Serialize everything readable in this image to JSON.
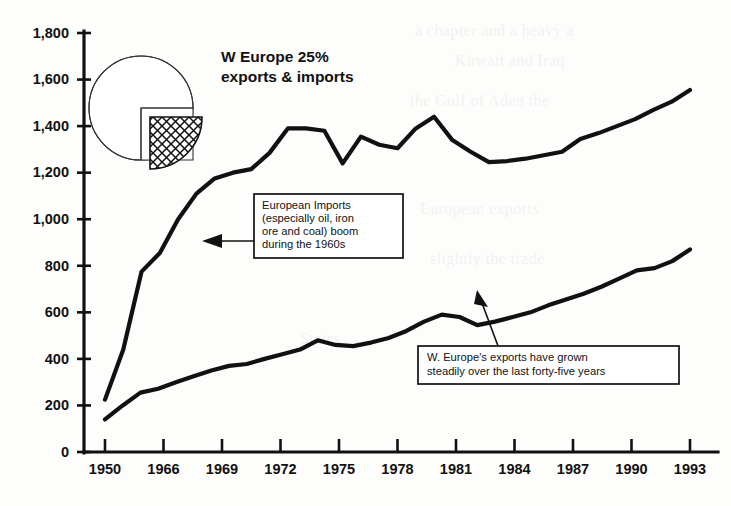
{
  "chart_data": {
    "type": "line",
    "xlabel": "",
    "ylabel": "",
    "ylim": [
      0,
      1800
    ],
    "ytick_step": 200,
    "yticks": [
      "0",
      "200",
      "400",
      "600",
      "800",
      "1,000",
      "1,200",
      "1,400",
      "1,600",
      "1,800"
    ],
    "ytick_values": [
      0,
      200,
      400,
      600,
      800,
      1000,
      1200,
      1400,
      1600,
      1800
    ],
    "xtick_labels": [
      "1950",
      "1966",
      "1969",
      "1972",
      "1975",
      "1978",
      "1981",
      "1984",
      "1987",
      "1990",
      "1993"
    ],
    "grid": false,
    "legend": "none",
    "series": [
      {
        "name": "European Imports",
        "values": [
          225,
          440,
          775,
          855,
          1000,
          1110,
          1175,
          1200,
          1215,
          1285,
          1390,
          1390,
          1380,
          1240,
          1355,
          1320,
          1305,
          1390,
          1440,
          1340,
          1290,
          1245,
          1250,
          1260,
          1275,
          1290,
          1345,
          1370,
          1400,
          1430,
          1470,
          1505,
          1555
        ],
        "x_positions": [
          0,
          1,
          2,
          3,
          4,
          5,
          6,
          7,
          8,
          9,
          10,
          11,
          12,
          13,
          14,
          15,
          16,
          17,
          18,
          19,
          20,
          21,
          22,
          23,
          24,
          25,
          26,
          27,
          28,
          29,
          30,
          31,
          32
        ]
      },
      {
        "name": "W. Europe exports",
        "values": [
          140,
          200,
          255,
          272,
          300,
          325,
          350,
          370,
          378,
          400,
          420,
          440,
          480,
          460,
          455,
          470,
          490,
          520,
          560,
          590,
          580,
          545,
          560,
          580,
          600,
          630,
          655,
          680,
          710,
          745,
          780,
          790,
          820,
          870
        ],
        "x_positions": [
          0,
          1,
          2,
          3,
          4,
          5,
          6,
          7,
          8,
          9,
          10,
          11,
          12,
          13,
          14,
          15,
          16,
          17,
          18,
          19,
          20,
          21,
          22,
          23,
          24,
          25,
          26,
          27,
          28,
          29,
          30,
          31,
          32,
          33
        ]
      }
    ],
    "annotations": [
      {
        "id": "imports-callout",
        "lines": [
          "European Imports",
          "(especially oil, iron",
          "ore and coal) boom",
          "during the 1960s"
        ],
        "arrow": "left"
      },
      {
        "id": "exports-callout",
        "lines": [
          "W. Europe's exports have grown",
          "steadily over the last forty-five years"
        ],
        "arrow": "up-left"
      }
    ],
    "pie": {
      "label": "W Europe 25% exports & imports",
      "title_line_1": "W Europe 25%",
      "title_line_2": "exports & imports",
      "slices": [
        {
          "name": "other",
          "percent": 75,
          "pattern": "none"
        },
        {
          "name": "w-europe-share",
          "percent": 25,
          "pattern": "crosshatch",
          "exploded": true
        }
      ]
    }
  },
  "colors": {
    "ink": "#111111",
    "paper": "#fdfdfc",
    "pie_outline": "#333333"
  },
  "ghost_text": [
    "a chapter and a heavy a",
    "Kuwait and Iraq",
    "the Gulf of Aden the",
    "European exports",
    "slightly the trade",
    "States"
  ]
}
